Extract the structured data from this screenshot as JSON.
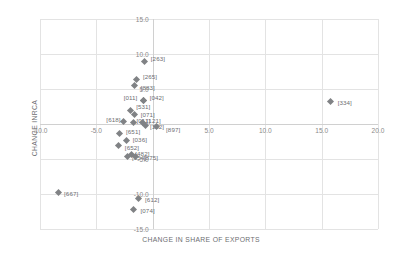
{
  "chart_data": {
    "type": "scatter",
    "title": "",
    "xlabel": "CHANGE IN SHARE OF EXPORTS",
    "ylabel": "CHANGE INRCA",
    "xlim": [
      -10.0,
      20.0
    ],
    "ylim": [
      -15.0,
      15.0
    ],
    "xticks": [
      "-10.0",
      "-5.0",
      "5.0",
      "10.0",
      "15.0",
      "20.0"
    ],
    "xtick_values": [
      -10.0,
      -5.0,
      5.0,
      10.0,
      15.0,
      20.0
    ],
    "yticks": [
      "15.0",
      "10.0",
      "5.0",
      "-5.0",
      "-10.0",
      "-15.0"
    ],
    "ytick_values": [
      15.0,
      10.0,
      5.0,
      -5.0,
      -10.0,
      -15.0
    ],
    "grid": true,
    "legend": false,
    "marker_color": "#808285",
    "points": [
      {
        "label": "[263]",
        "x": -0.7,
        "y": 9.0,
        "dx": 6,
        "dy": -3
      },
      {
        "label": "[265]",
        "x": -1.4,
        "y": 6.3,
        "dx": 6,
        "dy": -4
      },
      {
        "label": "[883]",
        "x": -1.6,
        "y": 5.5,
        "dx": 6,
        "dy": 1
      },
      {
        "label": "[011]",
        "x": -0.8,
        "y": 3.4,
        "dx": -20,
        "dy": -3
      },
      {
        "label": "[042]",
        "x": -0.8,
        "y": 3.4,
        "dx": 6,
        "dy": -3
      },
      {
        "label": "[531]",
        "x": -2.0,
        "y": 2.0,
        "dx": 6,
        "dy": -4
      },
      {
        "label": "[071]",
        "x": -1.6,
        "y": 1.4,
        "dx": 6,
        "dy": 0
      },
      {
        "label": "[618]",
        "x": -2.6,
        "y": 0.3,
        "dx": -17,
        "dy": -3
      },
      {
        "label": "[011]",
        "x": -1.7,
        "y": 0.2,
        "dx": 3,
        "dy": -3
      },
      {
        "label": "[121]",
        "x": -0.9,
        "y": 0.2,
        "dx": 4,
        "dy": -3
      },
      {
        "label": "[122]",
        "x": -0.6,
        "y": -0.2,
        "dx": 4,
        "dy": 1
      },
      {
        "label": "[897]",
        "x": 0.3,
        "y": -0.4,
        "dx": 10,
        "dy": 2
      },
      {
        "label": "[651]",
        "x": -2.9,
        "y": -1.3,
        "dx": 6,
        "dy": -2
      },
      {
        "label": "[036]",
        "x": -2.3,
        "y": -2.4,
        "dx": 6,
        "dy": -2
      },
      {
        "label": "[652]",
        "x": -3.0,
        "y": -3.1,
        "dx": 6,
        "dy": 1
      },
      {
        "label": "[482]",
        "x": -1.9,
        "y": -4.4,
        "dx": 4,
        "dy": -2
      },
      {
        "label": "[054]",
        "x": -2.2,
        "y": -4.6,
        "dx": 4,
        "dy": 1
      },
      {
        "label": "[875]",
        "x": -1.5,
        "y": -4.6,
        "dx": 8,
        "dy": 1
      },
      {
        "label": "[667]",
        "x": -8.4,
        "y": -9.8,
        "dx": 6,
        "dy": 0
      },
      {
        "label": "[612]",
        "x": -1.3,
        "y": -10.6,
        "dx": 7,
        "dy": 1
      },
      {
        "label": "[074]",
        "x": -1.7,
        "y": -12.2,
        "dx": 7,
        "dy": 1
      },
      {
        "label": "[334]",
        "x": 15.8,
        "y": 3.2,
        "dx": 7,
        "dy": 0
      }
    ]
  }
}
